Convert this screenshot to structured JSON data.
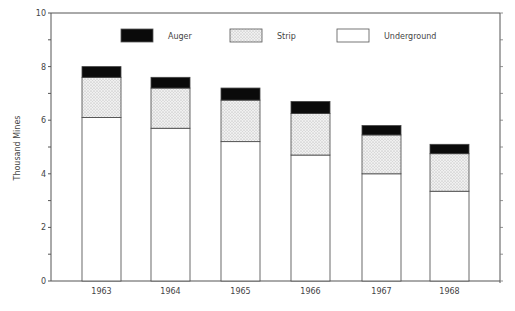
{
  "chart_data": {
    "type": "bar",
    "stacked": true,
    "title": "",
    "xlabel": "",
    "ylabel": "Thousand Mines",
    "ylim": [
      0,
      10
    ],
    "yticks": [
      0,
      2,
      4,
      6,
      8,
      10
    ],
    "categories": [
      "1963",
      "1964",
      "1965",
      "1966",
      "1967",
      "1968"
    ],
    "series": [
      {
        "name": "Underground",
        "fill": "#ffffff",
        "values": [
          6.1,
          5.7,
          5.2,
          4.7,
          4.0,
          3.35
        ]
      },
      {
        "name": "Strip",
        "fill": "#e6e6e6",
        "values": [
          1.5,
          1.5,
          1.55,
          1.55,
          1.45,
          1.4
        ]
      },
      {
        "name": "Auger",
        "fill": "#0a0a0a",
        "values": [
          0.4,
          0.4,
          0.45,
          0.45,
          0.35,
          0.35
        ]
      }
    ],
    "totals": [
      8.0,
      7.6,
      7.2,
      6.7,
      5.8,
      5.1
    ],
    "legend": {
      "position": "top",
      "entries": [
        "Auger",
        "Strip",
        "Underground"
      ]
    },
    "grid": false
  }
}
